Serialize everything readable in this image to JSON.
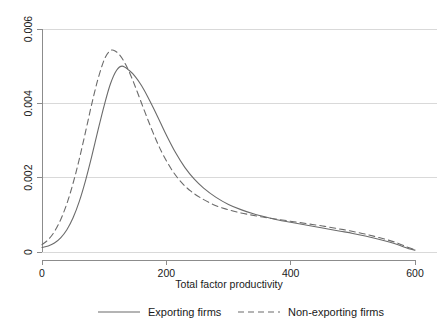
{
  "chart_data": {
    "type": "line",
    "title": "",
    "xlabel": "Total factor productivity",
    "ylabel": "",
    "xlim": [
      0,
      600
    ],
    "ylim": [
      0,
      0.006
    ],
    "xticks": [
      0,
      200,
      400,
      600
    ],
    "xtick_labels": [
      "0",
      "200",
      "400",
      "600"
    ],
    "yticks": [
      0,
      0.002,
      0.004,
      0.006
    ],
    "ytick_labels": [
      "0",
      "0.002",
      "0.004",
      "0.006"
    ],
    "grid": "horizontal",
    "legend_position": "bottom",
    "series": [
      {
        "name": "Exporting firms",
        "style": "solid",
        "color": "#6b6b6b",
        "x": [
          0,
          10,
          20,
          30,
          40,
          50,
          60,
          70,
          80,
          90,
          100,
          110,
          120,
          129,
          140,
          150,
          160,
          170,
          180,
          190,
          200,
          215,
          230,
          245,
          260,
          280,
          300,
          320,
          340,
          360,
          380,
          400,
          420,
          440,
          460,
          480,
          500,
          520,
          540,
          560,
          575,
          590,
          600
        ],
        "y": [
          0.00012,
          0.00016,
          0.00024,
          0.00038,
          0.0006,
          0.00092,
          0.00136,
          0.00192,
          0.00257,
          0.00327,
          0.00394,
          0.00452,
          0.00489,
          0.005,
          0.00489,
          0.00472,
          0.00448,
          0.00418,
          0.00385,
          0.0035,
          0.00315,
          0.00267,
          0.00227,
          0.00196,
          0.00172,
          0.00147,
          0.00128,
          0.00114,
          0.00103,
          0.00094,
          0.00086,
          0.0008,
          0.00074,
          0.00068,
          0.00062,
          0.00056,
          0.0005,
          0.00043,
          0.00035,
          0.00026,
          0.00018,
          9e-05,
          5e-05
        ]
      },
      {
        "name": "Non-exporting firms",
        "style": "dashed",
        "color": "#6b6b6b",
        "x": [
          0,
          10,
          20,
          30,
          40,
          50,
          60,
          70,
          80,
          90,
          100,
          108,
          115,
          125,
          135,
          145,
          155,
          165,
          175,
          185,
          195,
          210,
          225,
          240,
          255,
          275,
          295,
          315,
          335,
          355,
          375,
          395,
          415,
          435,
          455,
          475,
          495,
          515,
          535,
          555,
          572,
          588,
          600
        ],
        "y": [
          0.0002,
          0.00033,
          0.00055,
          0.00087,
          0.0013,
          0.00185,
          0.0025,
          0.00323,
          0.00398,
          0.00465,
          0.00517,
          0.00539,
          0.00543,
          0.0053,
          0.00503,
          0.00466,
          0.00423,
          0.00379,
          0.00336,
          0.00296,
          0.00261,
          0.00218,
          0.00186,
          0.00163,
          0.00146,
          0.00128,
          0.00116,
          0.00107,
          0.001,
          0.00094,
          0.00089,
          0.00084,
          0.00079,
          0.00074,
          0.00069,
          0.00063,
          0.00057,
          0.0005,
          0.00042,
          0.00033,
          0.00024,
          0.00013,
          6e-05
        ]
      }
    ]
  },
  "legend": {
    "items": [
      {
        "label": "Exporting firms",
        "style": "solid"
      },
      {
        "label": "Non-exporting firms",
        "style": "dashed"
      }
    ]
  },
  "colors": {
    "line": "#6b6b6b",
    "grid": "#d9d9d9",
    "axis": "#8c8c8c",
    "text": "#1a1a1a",
    "background": "#ffffff"
  }
}
